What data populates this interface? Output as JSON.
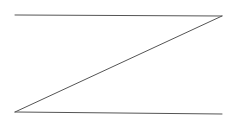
{
  "diagram": {
    "shape": "Z",
    "stroke_color": "#555555",
    "stroke_width": 1,
    "lines": [
      {
        "name": "top-line",
        "x1": 15,
        "y1": 15,
        "x2": 222,
        "y2": 16
      },
      {
        "name": "diagonal-line",
        "x1": 222,
        "y1": 16,
        "x2": 15,
        "y2": 112
      },
      {
        "name": "bottom-line",
        "x1": 15,
        "y1": 112,
        "x2": 222,
        "y2": 114
      }
    ]
  }
}
